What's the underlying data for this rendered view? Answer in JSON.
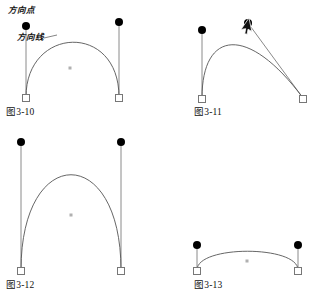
{
  "document": {
    "kind": "illustration-figure-set",
    "language": "zh",
    "background_color": "#ffffff",
    "ink_color": "#111111",
    "curve_color": "#555555",
    "handle_color": "#8a8a8a",
    "anchor_fill": "#ffffff",
    "anchor_stroke": "#777777",
    "direction_point_fill": "#000000",
    "midpoint_color": "#b0b0b0"
  },
  "annotations": [
    {
      "id": "direction-point",
      "label": "方向点",
      "x": 8,
      "y": 6
    },
    {
      "id": "direction-line",
      "label": "方向线",
      "x": 17,
      "y": 33
    }
  ],
  "figures": [
    {
      "id": "fig-3-10",
      "caption": "图3-10",
      "caption_x": 6,
      "caption_y": 108,
      "description": "round arch with two vertical direction lines",
      "curve": {
        "x1": 26,
        "y1": 97,
        "cx1": 26,
        "cy1": 26,
        "cx2": 119,
        "cy2": 22,
        "x2": 119,
        "y2": 97
      },
      "anchors": [
        {
          "x": 26,
          "y": 98
        },
        {
          "x": 119,
          "y": 98
        }
      ],
      "handles": [
        {
          "x1": 26,
          "y1": 97,
          "x2": 26,
          "y2": 26,
          "point_x": 26,
          "point_y": 26
        },
        {
          "x1": 119,
          "y1": 97,
          "x2": 119,
          "y2": 22,
          "point_x": 119,
          "point_y": 22
        }
      ],
      "midpoint": {
        "x": 70,
        "y": 68
      },
      "cursor": null
    },
    {
      "id": "fig-3-11",
      "caption": "图3-11",
      "caption_x": 194,
      "caption_y": 108,
      "description": "asymmetric arch, right direction point dragged up-left with pointer cursor",
      "curve": {
        "x1": 202,
        "y1": 98,
        "cx1": 202,
        "cy1": 30,
        "cx2": 248,
        "cy2": 24,
        "x2": 303,
        "y2": 98
      },
      "anchors": [
        {
          "x": 202,
          "y": 99
        },
        {
          "x": 303,
          "y": 99
        }
      ],
      "handles": [
        {
          "x1": 202,
          "y1": 98,
          "x2": 202,
          "y2": 30,
          "point_x": 202,
          "point_y": 30
        },
        {
          "x1": 303,
          "y1": 98,
          "x2": 248,
          "y2": 23,
          "point_x": 248,
          "point_y": 23
        }
      ],
      "midpoint": null,
      "cursor": {
        "x": 249,
        "y": 18,
        "rotation": 35
      }
    },
    {
      "id": "fig-3-12",
      "caption": "图3-12",
      "caption_x": 6,
      "caption_y": 281,
      "description": "tall narrow arch with two long vertical direction lines",
      "curve": {
        "x1": 21,
        "y1": 270,
        "cx1": 21,
        "cy1": 143,
        "cx2": 121,
        "cy2": 143,
        "x2": 121,
        "y2": 270
      },
      "anchors": [
        {
          "x": 21,
          "y": 271
        },
        {
          "x": 121,
          "y": 271
        }
      ],
      "handles": [
        {
          "x1": 21,
          "y1": 270,
          "x2": 21,
          "y2": 142,
          "point_x": 21,
          "point_y": 142
        },
        {
          "x1": 121,
          "y1": 270,
          "x2": 121,
          "y2": 142,
          "point_x": 121,
          "point_y": 142
        }
      ],
      "midpoint": {
        "x": 71,
        "y": 215
      },
      "cursor": null
    },
    {
      "id": "fig-3-13",
      "caption": "图3-13",
      "caption_x": 194,
      "caption_y": 281,
      "description": "shallow flat arch with two short vertical direction lines",
      "curve": {
        "x1": 197,
        "y1": 270,
        "cx1": 197,
        "cy1": 245,
        "cx2": 298,
        "cy2": 245,
        "x2": 298,
        "y2": 270
      },
      "anchors": [
        {
          "x": 197,
          "y": 271
        },
        {
          "x": 298,
          "y": 271
        }
      ],
      "handles": [
        {
          "x1": 197,
          "y1": 270,
          "x2": 197,
          "y2": 245,
          "point_x": 197,
          "point_y": 245
        },
        {
          "x1": 298,
          "y1": 270,
          "x2": 298,
          "y2": 245,
          "point_x": 298,
          "point_y": 245
        }
      ],
      "midpoint": {
        "x": 247,
        "y": 261
      },
      "cursor": null
    }
  ]
}
